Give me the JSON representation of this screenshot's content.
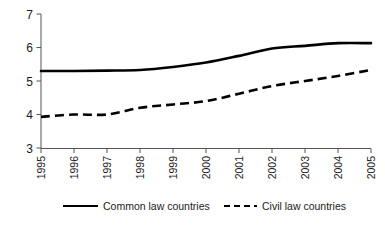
{
  "chart_data": {
    "type": "line",
    "title": "",
    "subtitle": "",
    "xlabel": "",
    "ylabel": "",
    "categories": [
      "1995",
      "1996",
      "1997",
      "1998",
      "1999",
      "2000",
      "2001",
      "2002",
      "2003",
      "2004",
      "2005"
    ],
    "x": [
      1995,
      1996,
      1997,
      1998,
      1999,
      2000,
      2001,
      2002,
      2003,
      2004,
      2005
    ],
    "series": [
      {
        "name": "Common law countries",
        "style": "solid",
        "color": "#000000",
        "values": [
          5.3,
          5.3,
          5.31,
          5.33,
          5.42,
          5.55,
          5.75,
          5.97,
          6.05,
          6.13,
          6.13
        ]
      },
      {
        "name": "Civil law countries",
        "style": "dashed",
        "color": "#000000",
        "values": [
          3.93,
          4.0,
          4.0,
          4.2,
          4.3,
          4.4,
          4.62,
          4.85,
          5.0,
          5.15,
          5.33
        ]
      }
    ],
    "ylim": [
      3,
      7
    ],
    "yticks": [
      3,
      4,
      5,
      6,
      7
    ],
    "ytick_labels": [
      "3",
      "4",
      "5",
      "6",
      "7"
    ],
    "xlim": [
      1995,
      2005
    ],
    "grid": false,
    "legend_position": "bottom",
    "xtick_label_rotation": -90,
    "axis_color": "#555555"
  },
  "legend": {
    "entries": [
      {
        "label": "Common law countries",
        "style": "solid"
      },
      {
        "label": "Civil law countries",
        "style": "dashed"
      }
    ]
  },
  "axis": {
    "y_labels": [
      "7",
      "6",
      "5",
      "4",
      "3"
    ],
    "x_labels": [
      "1995",
      "1996",
      "1997",
      "1998",
      "1999",
      "2000",
      "2001",
      "2002",
      "2003",
      "2004",
      "2005"
    ]
  }
}
